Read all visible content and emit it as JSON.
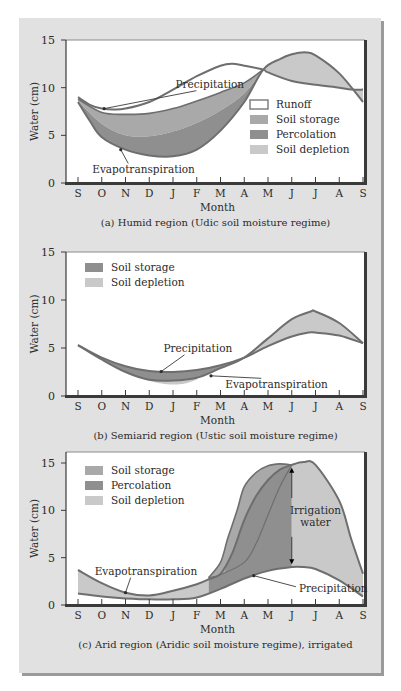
{
  "chart_data": [
    {
      "id": "a",
      "type": "area",
      "caption": "(a) Humid region (Udic soil moisture regime)",
      "xlabel": "Month",
      "ylabel": "Water (cm)",
      "ylim": [
        0,
        15
      ],
      "yticks": [
        0,
        5,
        10,
        15
      ],
      "categories": [
        "S",
        "O",
        "N",
        "D",
        "J",
        "F",
        "M",
        "A",
        "M",
        "J",
        "J",
        "A",
        "S"
      ],
      "grid": false,
      "legend": {
        "position": "right-middle",
        "entries": [
          {
            "label": "Runoff",
            "swatch": "outline"
          },
          {
            "label": "Soil storage",
            "swatch": "storage"
          },
          {
            "label": "Percolation",
            "swatch": "percolation"
          },
          {
            "label": "Soil depletion",
            "swatch": "depletion"
          }
        ]
      },
      "annotations": [
        {
          "text": "Precipitation",
          "label_xy": [
            4.1,
            10.0
          ],
          "point_xy": [
            1.1,
            7.8
          ]
        },
        {
          "text": "Evapotranspiration",
          "label_xy": [
            0.6,
            1.0
          ],
          "point_xy": [
            1.8,
            3.5
          ]
        }
      ],
      "series": [
        {
          "name": "Precipitation",
          "points": [
            [
              0,
              9.0
            ],
            [
              0.5,
              8.2
            ],
            [
              1,
              7.8
            ],
            [
              1.5,
              7.7
            ],
            [
              2,
              7.8
            ],
            [
              3,
              8.5
            ],
            [
              4,
              9.8
            ],
            [
              5,
              11.2
            ],
            [
              6,
              12.3
            ],
            [
              6.5,
              12.5
            ],
            [
              7,
              12.3
            ],
            [
              7.8,
              11.9
            ],
            [
              8,
              11.6
            ],
            [
              9,
              10.7
            ],
            [
              10,
              10.3
            ],
            [
              11,
              10.0
            ],
            [
              11.5,
              9.8
            ],
            [
              12,
              9.8
            ]
          ]
        },
        {
          "name": "Soil storage upper",
          "points": [
            [
              0,
              8.8
            ],
            [
              1,
              7.4
            ],
            [
              2,
              7.2
            ],
            [
              3,
              7.3
            ],
            [
              4,
              7.8
            ],
            [
              5,
              8.6
            ],
            [
              6,
              9.5
            ],
            [
              7,
              10.5
            ],
            [
              7.8,
              11.9
            ]
          ]
        },
        {
          "name": "Percolation upper",
          "points": [
            [
              0,
              8.6
            ],
            [
              1,
              6.2
            ],
            [
              2,
              5.0
            ],
            [
              3,
              4.9
            ],
            [
              4,
              5.4
            ],
            [
              5,
              6.3
            ],
            [
              6,
              7.6
            ],
            [
              7,
              9.4
            ],
            [
              7.8,
              11.9
            ]
          ]
        },
        {
          "name": "Evapotranspiration",
          "points": [
            [
              0,
              8.5
            ],
            [
              0.5,
              6.5
            ],
            [
              1,
              4.8
            ],
            [
              2,
              3.5
            ],
            [
              3,
              2.9
            ],
            [
              4,
              2.8
            ],
            [
              5,
              3.5
            ],
            [
              6,
              5.5
            ],
            [
              7,
              8.5
            ],
            [
              7.8,
              11.9
            ],
            [
              8.5,
              13.0
            ],
            [
              9,
              13.5
            ],
            [
              9.6,
              13.7
            ],
            [
              10,
              13.4
            ],
            [
              11,
              11.5
            ],
            [
              12,
              8.5
            ]
          ]
        }
      ]
    },
    {
      "id": "b",
      "type": "area",
      "caption": "(b) Semiarid region (Ustic soil moisture regime)",
      "xlabel": "Month",
      "ylabel": "Water (cm)",
      "ylim": [
        0,
        15
      ],
      "yticks": [
        0,
        5,
        10,
        15
      ],
      "categories": [
        "S",
        "O",
        "N",
        "D",
        "J",
        "F",
        "M",
        "A",
        "M",
        "J",
        "J",
        "A",
        "S"
      ],
      "grid": false,
      "legend": {
        "position": "top-left",
        "entries": [
          {
            "label": "Soil storage",
            "swatch": "percolation"
          },
          {
            "label": "Soil depletion",
            "swatch": "depletion"
          }
        ]
      },
      "annotations": [
        {
          "text": "Precipitation",
          "label_xy": [
            3.6,
            4.6
          ],
          "point_xy": [
            3.5,
            2.55
          ]
        },
        {
          "text": "Evapotranspiration",
          "label_xy": [
            6.2,
            0.8
          ],
          "point_xy": [
            5.6,
            2.1
          ]
        }
      ],
      "series": [
        {
          "name": "Precipitation",
          "points": [
            [
              0,
              5.3
            ],
            [
              1,
              4.0
            ],
            [
              2,
              3.1
            ],
            [
              3,
              2.6
            ],
            [
              4,
              2.5
            ],
            [
              5,
              2.7
            ],
            [
              6,
              3.2
            ],
            [
              7,
              4.0
            ],
            [
              8,
              5.2
            ],
            [
              9,
              6.2
            ],
            [
              9.7,
              6.6
            ],
            [
              10,
              6.6
            ],
            [
              11,
              6.3
            ],
            [
              12,
              5.5
            ]
          ]
        },
        {
          "name": "Evapotranspiration",
          "points": [
            [
              0,
              5.3
            ],
            [
              1,
              3.8
            ],
            [
              2,
              2.5
            ],
            [
              3,
              1.7
            ],
            [
              4,
              1.6
            ],
            [
              5,
              1.9
            ],
            [
              6,
              2.9
            ],
            [
              7,
              4.0
            ],
            [
              8,
              6.0
            ],
            [
              9,
              8.0
            ],
            [
              9.8,
              8.8
            ],
            [
              10,
              8.8
            ],
            [
              11,
              7.6
            ],
            [
              12,
              5.5
            ]
          ]
        },
        {
          "name": "Soil depletion lower",
          "points": [
            [
              2.8,
              1.7
            ],
            [
              3.5,
              1.3
            ],
            [
              4,
              1.2
            ],
            [
              4.5,
              1.3
            ],
            [
              5,
              1.7
            ]
          ]
        }
      ]
    },
    {
      "id": "c",
      "type": "area",
      "caption": "(c) Arid region (Aridic soil moisture regime), irrigated",
      "xlabel": "Month",
      "ylabel": "Water (cm)",
      "ylim": [
        0,
        15
      ],
      "yticks": [
        0,
        5,
        10,
        15
      ],
      "categories": [
        "S",
        "O",
        "N",
        "D",
        "J",
        "F",
        "M",
        "A",
        "M",
        "J",
        "J",
        "A",
        "S"
      ],
      "grid": false,
      "legend": {
        "position": "top-left",
        "entries": [
          {
            "label": "Soil storage",
            "swatch": "storage"
          },
          {
            "label": "Percolation",
            "swatch": "percolation"
          },
          {
            "label": "Soil depletion",
            "swatch": "depletion"
          }
        ]
      },
      "annotations": [
        {
          "text": "Evapotranspiration",
          "label_xy": [
            0.7,
            3.2
          ],
          "point_xy": [
            2.0,
            1.3
          ]
        },
        {
          "text": "Precipitation",
          "label_xy": [
            9.3,
            1.4
          ],
          "point_xy": [
            7.4,
            3.1
          ]
        },
        {
          "text": "Irrigation",
          "label_xy": [
            10.0,
            9.6
          ],
          "point_xy": null
        },
        {
          "text": "water",
          "label_xy": [
            10.0,
            8.3
          ],
          "point_xy": null
        }
      ],
      "irrigation_arrow": {
        "x": 9.0,
        "from": 14.6,
        "to": 4.2
      },
      "series": [
        {
          "name": "Precipitation",
          "points": [
            [
              0,
              1.2
            ],
            [
              1,
              0.9
            ],
            [
              2,
              0.7
            ],
            [
              3,
              0.6
            ],
            [
              4,
              0.6
            ],
            [
              5,
              0.8
            ],
            [
              6,
              1.7
            ],
            [
              7,
              2.8
            ],
            [
              8,
              3.6
            ],
            [
              9,
              4.0
            ],
            [
              9.5,
              4.0
            ],
            [
              10,
              3.8
            ],
            [
              11,
              2.6
            ],
            [
              12,
              0.9
            ]
          ]
        },
        {
          "name": "Evapotranspiration",
          "points": [
            [
              0,
              3.7
            ],
            [
              1,
              2.3
            ],
            [
              2,
              1.3
            ],
            [
              3,
              1.0
            ],
            [
              4,
              1.5
            ],
            [
              5,
              2.2
            ],
            [
              5.5,
              2.7
            ],
            [
              6,
              3.3
            ],
            [
              6.5,
              5.5
            ],
            [
              7,
              9.0
            ],
            [
              7.5,
              11.5
            ],
            [
              8,
              13.2
            ],
            [
              8.5,
              14.3
            ],
            [
              9,
              14.8
            ],
            [
              9.5,
              15.1
            ],
            [
              10,
              14.8
            ],
            [
              11,
              11.0
            ],
            [
              11.5,
              7.0
            ],
            [
              12,
              3.3
            ]
          ]
        },
        {
          "name": "Soil storage upper",
          "points": [
            [
              5.5,
              2.9
            ],
            [
              6,
              4.5
            ],
            [
              6.3,
              7.0
            ],
            [
              6.7,
              10.0
            ],
            [
              7,
              12.5
            ],
            [
              7.5,
              14.0
            ],
            [
              8,
              14.7
            ],
            [
              8.5,
              14.9
            ],
            [
              9,
              14.8
            ]
          ]
        },
        {
          "name": "Percolation lower",
          "points": [
            [
              5.5,
              2.9
            ],
            [
              6,
              3.2
            ],
            [
              7,
              4.5
            ],
            [
              7.5,
              6.5
            ],
            [
              8,
              9.5
            ],
            [
              8.5,
              12.5
            ],
            [
              9,
              14.8
            ]
          ]
        }
      ]
    }
  ],
  "colors": {
    "panel_bg": "#e1e1e1",
    "plot_bg": "#ffffff",
    "line": "#6e6e6e",
    "axis": "#3a3a3a",
    "storage": "#a9a9a9",
    "percolation": "#8f8f8f",
    "depletion": "#c9c9c9",
    "runoff": "#ffffff"
  }
}
